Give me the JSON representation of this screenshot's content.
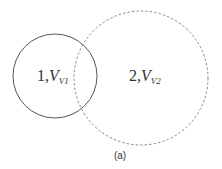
{
  "diagram": {
    "regions": [
      {
        "id": "1",
        "label_prefix": "1,",
        "variable": "V",
        "subscript": "V1",
        "border": "solid",
        "color": "#555555"
      },
      {
        "id": "2",
        "label_prefix": "2,",
        "variable": "V",
        "subscript": "V2",
        "border": "dashed",
        "color": "#888888"
      }
    ],
    "caption": "(a)"
  }
}
